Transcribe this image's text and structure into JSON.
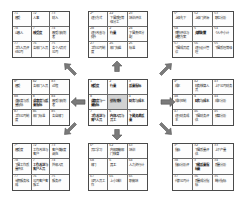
{
  "diagram": {
    "type": "nine-palace-grid-mindmap",
    "layout": "3x3 arrangement of 3x3 tables connected by eight arrows radiating from the center table",
    "grid_order": [
      "top-left",
      "top-center",
      "top-right",
      "middle-left",
      "center",
      "middle-right",
      "bottom-left",
      "bottom-center",
      "bottom-right"
    ]
  },
  "colors": {
    "background": "#ffffff",
    "grid_border": "#4a4a4a",
    "cell_border": "#6a6a6a",
    "text": "#2b2b2b",
    "arrow": "#6d6d6d",
    "highlight_fill": "#d2d2d2"
  },
  "arrows": [
    {
      "name": "arrow-up",
      "direction": "up",
      "glyph": "⇧"
    },
    {
      "name": "arrow-down",
      "direction": "down",
      "glyph": "⇩"
    },
    {
      "name": "arrow-left",
      "direction": "left",
      "glyph": "⇦"
    },
    {
      "name": "arrow-right",
      "direction": "right",
      "glyph": "⇨"
    },
    {
      "name": "arrow-up-left",
      "direction": "up-left",
      "glyph": "↖"
    },
    {
      "name": "arrow-up-right",
      "direction": "up-right",
      "glyph": "↗"
    },
    {
      "name": "arrow-down-left",
      "direction": "down-left",
      "glyph": "↙"
    },
    {
      "name": "arrow-down-right",
      "direction": "down-right",
      "glyph": "↘"
    }
  ],
  "grids": {
    "top_left": {
      "name": "grid-top-left",
      "cells": [
        {
          "num": "71",
          "text": "感受",
          "bold": false,
          "shaded": false
        },
        {
          "num": "72",
          "text": "人事",
          "bold": false,
          "shaded": false
        },
        {
          "num": "73",
          "text": "财入",
          "bold": false,
          "shaded": false
        },
        {
          "num": "78",
          "text": "山感人",
          "bold": false,
          "shaded": false
        },
        {
          "num": "7",
          "text": "感受度",
          "bold": true,
          "shaded": false
        },
        {
          "num": "74",
          "text": "感受与规划者",
          "bold": false,
          "shaded": false
        },
        {
          "num": "77",
          "text": "工作人员评价公司",
          "bold": false,
          "shaded": false
        },
        {
          "num": "76",
          "text": "各部门人员",
          "bold": false,
          "shaded": false
        },
        {
          "num": "75",
          "text": "各个人员对公司",
          "bold": false,
          "shaded": false
        }
      ]
    },
    "top_center": {
      "name": "grid-top-center",
      "cells": [
        {
          "num": "2¹",
          "text": "运行方式",
          "bold": false,
          "shaded": false
        },
        {
          "num": "22",
          "text": "下属质理等级分工",
          "bold": false,
          "shaded": false
        },
        {
          "num": "23",
          "text": "培训评估",
          "bold": false,
          "shaded": false
        },
        {
          "num": "28",
          "text": "运行改善与提升",
          "bold": false,
          "shaded": false
        },
        {
          "num": "2",
          "text": "行量",
          "bold": true,
          "shaded": false
        },
        {
          "num": "24",
          "text": "下属责任分配",
          "bold": false,
          "shaded": false
        },
        {
          "num": "27",
          "text": "工作公司制度",
          "bold": false,
          "shaded": false
        },
        {
          "num": "26",
          "text": "部门标准",
          "bold": false,
          "shaded": false
        },
        {
          "num": "25",
          "text": "标准",
          "bold": false,
          "shaded": false
        }
      ]
    },
    "top_right": {
      "name": "grid-top-right",
      "cells": [
        {
          "num": "5¹",
          "text": "上级先下",
          "bold": false,
          "shaded": false
        },
        {
          "num": "52",
          "text": "上级门资源",
          "bold": false,
          "shaded": false
        },
        {
          "num": "53",
          "text": "职位分析",
          "bold": false,
          "shaded": false
        },
        {
          "num": "58",
          "text": "情构评估与调整方案",
          "bold": false,
          "shaded": false
        },
        {
          "num": "5",
          "text": "资源配置",
          "bold": true,
          "shaded": false
        },
        {
          "num": "54",
          "text": "个人中小计",
          "bold": false,
          "shaded": false
        },
        {
          "num": "57",
          "text": "下属成员建议",
          "bold": false,
          "shaded": false
        },
        {
          "num": "56",
          "text": "运行设计管理",
          "bold": false,
          "shaded": false
        },
        {
          "num": "55",
          "text": "下属质理等级",
          "bold": false,
          "shaded": false
        }
      ]
    },
    "middle_left": {
      "name": "grid-middle-left",
      "cells": [
        {
          "num": "8¹",
          "text": "感受",
          "bold": false,
          "shaded": false
        },
        {
          "num": "82",
          "text": "各部门人员",
          "bold": false,
          "shaded": false
        },
        {
          "num": "83",
          "text": "过程",
          "bold": false,
          "shaded": false
        },
        {
          "num": "88",
          "text": "满意度与质量指标",
          "bold": false,
          "shaded": false
        },
        {
          "num": "8",
          "text": "满意度与质量指标",
          "bold": true,
          "shaded": false
        },
        {
          "num": "84",
          "text": "感受与规划者",
          "bold": false,
          "shaded": false
        },
        {
          "num": "87",
          "text": "工作公司制度",
          "bold": false,
          "shaded": false
        },
        {
          "num": "86",
          "text": "部门标准",
          "bold": false,
          "shaded": false
        },
        {
          "num": "85",
          "text": "各自部门",
          "bold": false,
          "shaded": false
        }
      ]
    },
    "center": {
      "name": "grid-center",
      "cells": [
        {
          "num": "1",
          "text": "感受度",
          "bold": true,
          "shaded": false
        },
        {
          "num": "2",
          "text": "行量",
          "bold": true,
          "shaded": false
        },
        {
          "num": "3",
          "text": "质量指标",
          "bold": true,
          "shaded": false
        },
        {
          "num": "8",
          "text": "满意度与一量指标",
          "bold": true,
          "shaded": false
        },
        {
          "num": "",
          "text": "绩效考核",
          "bold": true,
          "shaded": true
        },
        {
          "num": "4",
          "text": "财务与成本",
          "bold": true,
          "shaded": false
        },
        {
          "num": "7",
          "text": "工作改进与客户人员",
          "bold": true,
          "shaded": false
        },
        {
          "num": "6",
          "text": "内部人员与员工",
          "bold": true,
          "shaded": false
        },
        {
          "num": "5",
          "text": "下属资源质量",
          "bold": true,
          "shaded": false
        }
      ]
    },
    "middle_right": {
      "name": "grid-middle-right",
      "cells": [
        {
          "num": "4¹",
          "text": "成本",
          "bold": false,
          "shaded": false
        },
        {
          "num": "42",
          "text": "财务核算人员",
          "bold": false,
          "shaded": false
        },
        {
          "num": "43",
          "text": "上下公司财务",
          "bold": false,
          "shaded": false
        },
        {
          "num": "48",
          "text": "成本控制",
          "bold": false,
          "shaded": false
        },
        {
          "num": "4",
          "text": "财务与成本",
          "bold": true,
          "shaded": false
        },
        {
          "num": "44",
          "text": "成本分析",
          "bold": false,
          "shaded": false
        },
        {
          "num": "47",
          "text": "运行财务成本",
          "bold": false,
          "shaded": false
        },
        {
          "num": "46",
          "text": "下属财务评估",
          "bold": false,
          "shaded": false
        },
        {
          "num": "45",
          "text": "预算分析",
          "bold": false,
          "shaded": false
        }
      ]
    },
    "bottom_left": {
      "name": "grid-bottom-left",
      "cells": [
        {
          "num": "7¹",
          "text": "感受度",
          "bold": false,
          "shaded": false
        },
        {
          "num": "72",
          "text": "工作改进与客户",
          "bold": false,
          "shaded": false
        },
        {
          "num": "73",
          "text": "客户满意度调充",
          "bold": false,
          "shaded": false
        },
        {
          "num": "78",
          "text": "下属工作质量评估",
          "bold": false,
          "shaded": false
        },
        {
          "num": "7",
          "text": "工作改进与客户人员",
          "bold": true,
          "shaded": false
        },
        {
          "num": "74",
          "text": "外部人员",
          "bold": false,
          "shaded": false
        },
        {
          "num": "77",
          "text": "长期服务栈成",
          "bold": false,
          "shaded": false
        },
        {
          "num": "76",
          "text": "公司客户客服工",
          "bold": false,
          "shaded": false
        },
        {
          "num": "75",
          "text": "服务评",
          "bold": false,
          "shaded": false
        }
      ]
    },
    "bottom_center": {
      "name": "grid-bottom-center",
      "cells": [
        {
          "num": "6¹",
          "text": "员工学习",
          "bold": false,
          "shaded": false
        },
        {
          "num": "62",
          "text": "内部职能部门核算",
          "bold": false,
          "shaded": false
        },
        {
          "num": "63",
          "text": "培训",
          "bold": false,
          "shaded": false
        },
        {
          "num": "68",
          "text": "部门",
          "bold": false,
          "shaded": false
        },
        {
          "num": "6",
          "text": "员工",
          "bold": true,
          "shaded": false
        },
        {
          "num": "64",
          "text": "人力资行计",
          "bold": false,
          "shaded": false
        },
        {
          "num": "67",
          "text": "公司人员工作",
          "bold": false,
          "shaded": false
        },
        {
          "num": "66",
          "text": "上小培训",
          "bold": false,
          "shaded": false
        },
        {
          "num": "65",
          "text": "职能培",
          "bold": false,
          "shaded": false
        }
      ]
    },
    "bottom_right": {
      "name": "grid-bottom-right",
      "cells": [
        {
          "num": "3¹",
          "text": "指标",
          "bold": false,
          "shaded": false
        },
        {
          "num": "32",
          "text": "下属质量评估",
          "bold": false,
          "shaded": false
        },
        {
          "num": "33",
          "text": "上下产量",
          "bold": false,
          "shaded": false
        },
        {
          "num": "38",
          "text": "指标分析评",
          "bold": false,
          "shaded": false
        },
        {
          "num": "3",
          "text": "下属质量指标量",
          "bold": true,
          "shaded": false
        },
        {
          "num": "34",
          "text": "质量分析",
          "bold": false,
          "shaded": false
        },
        {
          "num": "37",
          "text": "代表公司计",
          "bold": false,
          "shaded": false
        },
        {
          "num": "36",
          "text": "质量成分指标",
          "bold": false,
          "shaded": false
        },
        {
          "num": "35",
          "text": "统计指标",
          "bold": false,
          "shaded": false
        }
      ]
    }
  }
}
